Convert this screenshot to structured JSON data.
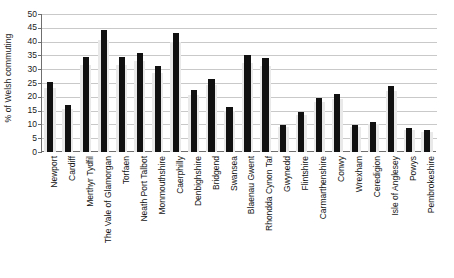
{
  "chart_data": {
    "type": "bar",
    "title": "",
    "subtitle": "",
    "xlabel": "",
    "ylabel": "% of Welsh commuting",
    "ylim": [
      0,
      50
    ],
    "ytick_step": 5,
    "yticks": [
      0,
      5,
      10,
      15,
      20,
      25,
      30,
      35,
      40,
      45,
      50
    ],
    "ytick_labels": [
      "0",
      "5",
      "10",
      "15",
      "20",
      "25",
      "30",
      "35",
      "40",
      "45",
      "50"
    ],
    "grid": true,
    "legend": "none",
    "bar_color": "#111111",
    "gridline_color": "#c9c9c9",
    "axis_color": "#6f6f6f",
    "categories": [
      "Newport",
      "Cardiff",
      "Merthyr Tydfil",
      "The Vale of Glamorgan",
      "Torfaen",
      "Neath Port Talbot",
      "Monmouthshire",
      "Caerphilly",
      "Denbighshire",
      "Bridgend",
      "Swansea",
      "Blaenau Gwent",
      "Rhondda Cynon Taf",
      "Gwynedd",
      "Flintshire",
      "Carmarthenshire",
      "Conwy",
      "Wrexham",
      "Ceredigion",
      "Isle of Anglesey",
      "Powys",
      "Pembrokeshire"
    ],
    "values": [
      25.3,
      17.0,
      34.3,
      44.1,
      34.3,
      36.0,
      31.0,
      43.2,
      22.4,
      26.3,
      16.3,
      35.2,
      34.0,
      9.8,
      14.4,
      19.7,
      20.9,
      9.8,
      11.0,
      23.9,
      8.8,
      7.9
    ]
  }
}
